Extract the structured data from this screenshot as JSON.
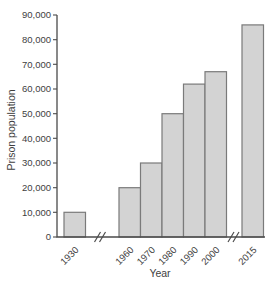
{
  "chart_data": {
    "type": "bar",
    "title": "",
    "xlabel": "Year",
    "ylabel": "Prison population",
    "categories": [
      "1930",
      "1960",
      "1970",
      "1980",
      "1990",
      "2000",
      "2015"
    ],
    "values": [
      10000,
      20000,
      30000,
      50000,
      62000,
      67000,
      86000
    ],
    "ylim": [
      0,
      90000
    ],
    "ytick_step": 10000,
    "ytick_labels": [
      "0",
      "10,000",
      "20,000",
      "30,000",
      "40,000",
      "50,000",
      "60,000",
      "70,000",
      "80,000",
      "90,000"
    ],
    "x_axis_breaks_after": [
      "1930",
      "2000"
    ],
    "grid": false,
    "legend": "none",
    "colors": {
      "background": "#ffffff",
      "bar_fill": "#d3d3d3",
      "bar_stroke": "#7a7a7a",
      "axis": "#4b4b4b",
      "text": "#3e3e3e"
    }
  }
}
